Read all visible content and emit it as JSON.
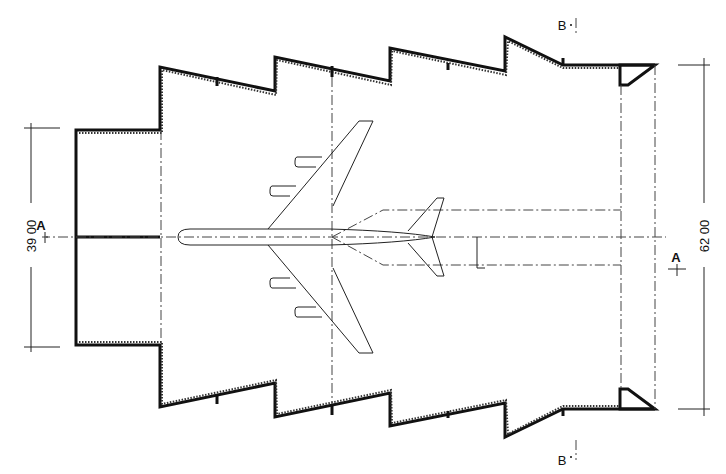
{
  "drawing": {
    "type": "architectural-plan",
    "subject": "aircraft hangar plan with sawtooth walls and jet airliner",
    "colors": {
      "ink": "#111111",
      "paper": "#ffffff"
    }
  },
  "dimensions": {
    "left": {
      "label": "39 00"
    },
    "right": {
      "label": "62 00"
    }
  },
  "section_markers": {
    "a_left": {
      "label": "A"
    },
    "a_right": {
      "label": "A"
    },
    "b_top": {
      "label": "B"
    },
    "b_bottom": {
      "label": "B"
    }
  },
  "icons": {
    "airplane": "airplane-plan-icon",
    "section_arrow": "section-arrow-icon"
  }
}
